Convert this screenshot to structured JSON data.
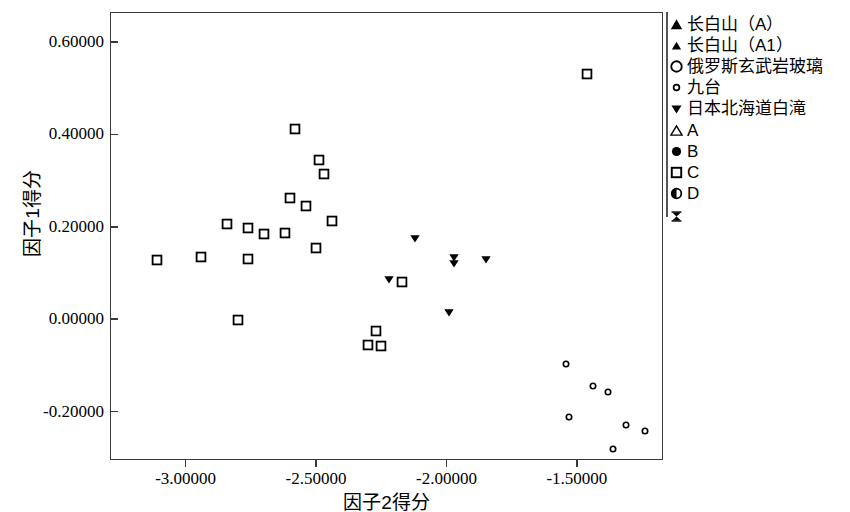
{
  "chart_data": {
    "type": "scatter",
    "title": "",
    "xlabel": "因子2得分",
    "ylabel": "因子1得分",
    "xlim": [
      -3.29,
      -1.17
    ],
    "ylim": [
      -0.305,
      0.665
    ],
    "xticks": [
      -3.0,
      -2.5,
      -2.0,
      -1.5
    ],
    "xticklabels": [
      "-3.00000",
      "-2.50000",
      "-2.00000",
      "-1.50000"
    ],
    "yticks": [
      0.6,
      0.4,
      0.2,
      0.0,
      -0.2
    ],
    "yticklabels": [
      "0.60000",
      "0.40000",
      "0.20000",
      "0.00000",
      "-0.20000"
    ],
    "grid": false,
    "legend_position": "right",
    "series": [
      {
        "name": "长白山（A）",
        "marker": "triangle-up-filled-large",
        "points": []
      },
      {
        "name": "长白山（A1）",
        "marker": "triangle-up-filled-small",
        "points": []
      },
      {
        "name": "俄罗斯玄武岩玻璃",
        "marker": "circle-open-large",
        "points": []
      },
      {
        "name": "九台",
        "marker": "circle-open-small",
        "points": [
          {
            "x": -1.54,
            "y": -0.097
          },
          {
            "x": -1.44,
            "y": -0.145
          },
          {
            "x": -1.38,
            "y": -0.157
          },
          {
            "x": -1.53,
            "y": -0.212
          },
          {
            "x": -1.31,
            "y": -0.23
          },
          {
            "x": -1.24,
            "y": -0.243
          },
          {
            "x": -1.36,
            "y": -0.282
          }
        ]
      },
      {
        "name": "日本北海道白滝",
        "marker": "triangle-down-filled",
        "points": [
          {
            "x": -2.12,
            "y": 0.175
          },
          {
            "x": -1.97,
            "y": 0.135
          },
          {
            "x": -1.97,
            "y": 0.122
          },
          {
            "x": -1.85,
            "y": 0.131
          },
          {
            "x": -2.22,
            "y": 0.086
          },
          {
            "x": -1.99,
            "y": 0.016
          }
        ]
      },
      {
        "name": "A",
        "marker": "triangle-up-open",
        "points": []
      },
      {
        "name": "B",
        "marker": "circle-filled",
        "points": []
      },
      {
        "name": "C",
        "marker": "square-open",
        "points": [
          {
            "x": -1.46,
            "y": 0.53
          },
          {
            "x": -2.58,
            "y": 0.412
          },
          {
            "x": -2.49,
            "y": 0.345
          },
          {
            "x": -2.47,
            "y": 0.315
          },
          {
            "x": -2.6,
            "y": 0.262
          },
          {
            "x": -2.54,
            "y": 0.245
          },
          {
            "x": -2.44,
            "y": 0.212
          },
          {
            "x": -2.84,
            "y": 0.207
          },
          {
            "x": -2.76,
            "y": 0.197
          },
          {
            "x": -2.62,
            "y": 0.187
          },
          {
            "x": -2.7,
            "y": 0.185
          },
          {
            "x": -2.5,
            "y": 0.155
          },
          {
            "x": -3.11,
            "y": 0.128
          },
          {
            "x": -2.94,
            "y": 0.134
          },
          {
            "x": -2.76,
            "y": 0.13
          },
          {
            "x": -2.17,
            "y": 0.08
          },
          {
            "x": -2.8,
            "y": -0.002
          },
          {
            "x": -2.27,
            "y": -0.026
          },
          {
            "x": -2.3,
            "y": -0.056
          },
          {
            "x": -2.25,
            "y": -0.059
          }
        ]
      },
      {
        "name": "D",
        "marker": "circle-half-filled",
        "points": []
      },
      {
        "name": "",
        "marker": "hourglass",
        "points": []
      }
    ]
  },
  "axes": {
    "xlabel": "因子2得分",
    "ylabel": "因子1得分"
  },
  "legend": {
    "items": [
      {
        "label": "长白山（A）",
        "marker": "triangle-up-filled-large"
      },
      {
        "label": "长白山（A1）",
        "marker": "triangle-up-filled-small"
      },
      {
        "label": "俄罗斯玄武岩玻璃",
        "marker": "circle-open-large"
      },
      {
        "label": "九台",
        "marker": "circle-open-small"
      },
      {
        "label": "日本北海道白滝",
        "marker": "triangle-down-filled"
      },
      {
        "label": "A",
        "marker": "triangle-up-open"
      },
      {
        "label": "B",
        "marker": "circle-filled"
      },
      {
        "label": "C",
        "marker": "square-open"
      },
      {
        "label": "D",
        "marker": "circle-half-filled"
      },
      {
        "label": "",
        "marker": "hourglass"
      }
    ]
  },
  "colors": {
    "ink": "#000000",
    "frame": "#3a3a3a",
    "background": "#ffffff"
  }
}
